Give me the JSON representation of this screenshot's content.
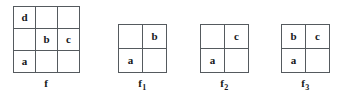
{
  "figure": {
    "background_color": "#ffffff",
    "border_color": "#555a5e",
    "text_color": "#16181a"
  },
  "grids": [
    {
      "id": "f",
      "label": "f",
      "subscript": "",
      "rows": 3,
      "cols": 3,
      "cells": [
        [
          "d",
          "",
          ""
        ],
        [
          "",
          "b",
          "c"
        ],
        [
          "a",
          "",
          ""
        ]
      ]
    },
    {
      "id": "f1",
      "label": "f",
      "subscript": "1",
      "rows": 2,
      "cols": 2,
      "cells": [
        [
          "",
          "b"
        ],
        [
          "a",
          ""
        ]
      ]
    },
    {
      "id": "f2",
      "label": "f",
      "subscript": "2",
      "rows": 2,
      "cols": 2,
      "cells": [
        [
          "",
          "c"
        ],
        [
          "a",
          ""
        ]
      ]
    },
    {
      "id": "f3",
      "label": "f",
      "subscript": "3",
      "rows": 2,
      "cols": 2,
      "cells": [
        [
          "b",
          "c"
        ],
        [
          "a",
          ""
        ]
      ]
    }
  ]
}
